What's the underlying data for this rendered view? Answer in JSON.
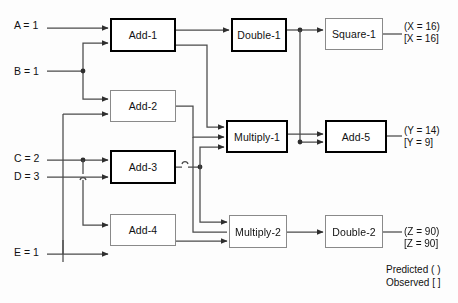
{
  "diagram": {
    "inputs": [
      {
        "id": "A",
        "label": "A = 1",
        "x": 14,
        "y": 19
      },
      {
        "id": "B",
        "label": "B = 1",
        "x": 14,
        "y": 65
      },
      {
        "id": "C",
        "label": "C = 2",
        "x": 14,
        "y": 152
      },
      {
        "id": "D",
        "label": "D = 3",
        "x": 14,
        "y": 175
      },
      {
        "id": "E",
        "label": "E = 1",
        "x": 14,
        "y": 246
      }
    ],
    "nodes": [
      {
        "id": "add1",
        "label": "Add-1",
        "x": 110,
        "y": 18,
        "w": 66,
        "h": 34,
        "weight": "thick"
      },
      {
        "id": "add2",
        "label": "Add-2",
        "x": 110,
        "y": 90,
        "w": 66,
        "h": 32,
        "weight": "thin"
      },
      {
        "id": "add3",
        "label": "Add-3",
        "x": 110,
        "y": 150,
        "w": 66,
        "h": 34,
        "weight": "thick"
      },
      {
        "id": "add4",
        "label": "Add-4",
        "x": 110,
        "y": 214,
        "w": 66,
        "h": 32,
        "weight": "thin"
      },
      {
        "id": "double1",
        "label": "Double-1",
        "x": 231,
        "y": 18,
        "w": 56,
        "h": 34,
        "weight": "thick"
      },
      {
        "id": "multiply1",
        "label": "Multiply-1",
        "x": 226,
        "y": 120,
        "w": 62,
        "h": 33,
        "weight": "thick"
      },
      {
        "id": "multiply2",
        "label": "Multiply-2",
        "x": 229,
        "y": 215,
        "w": 58,
        "h": 33,
        "weight": "thin"
      },
      {
        "id": "square1",
        "label": "Square-1",
        "x": 325,
        "y": 18,
        "w": 58,
        "h": 32,
        "weight": "thin"
      },
      {
        "id": "add5",
        "label": "Add-5",
        "x": 325,
        "y": 120,
        "w": 62,
        "h": 33,
        "weight": "thick"
      },
      {
        "id": "double2",
        "label": "Double-2",
        "x": 325,
        "y": 215,
        "w": 58,
        "h": 33,
        "weight": "thin"
      }
    ],
    "outputs": [
      {
        "id": "X",
        "predicted": "(X = 16)",
        "observed": "[X = 16]",
        "x": 404,
        "y": 21
      },
      {
        "id": "Y",
        "predicted": "(Y = 14)",
        "observed": "[Y = 9]",
        "x": 404,
        "y": 125
      },
      {
        "id": "Z",
        "predicted": "(Z = 90)",
        "observed": "[Z = 90]",
        "x": 404,
        "y": 230
      }
    ],
    "legend": {
      "predicted": "Predicted ( )",
      "observed": "Observed [ ]",
      "x": 386,
      "y": 264
    },
    "colors": {
      "wire": "#4a4a4a",
      "node_border_thin": "#8a8a8a",
      "node_border_thick": "#000000",
      "text": "#111111",
      "background": "#fdfdfd"
    }
  }
}
